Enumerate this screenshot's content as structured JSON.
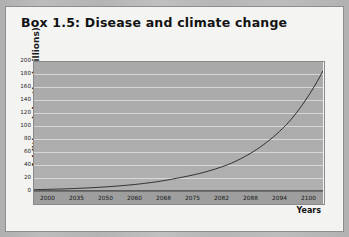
{
  "page": {
    "background_color": "#b6b6b6",
    "card_background": "#f3f3f2",
    "border_color": "#8d8d8d"
  },
  "box": {
    "title": "Box 1.5: Disease and climate change"
  },
  "chart_data": {
    "type": "line",
    "title": "",
    "xlabel": "Years",
    "ylabel": "Additional deaths (millions)",
    "categories": [
      "2000",
      "2035",
      "2050",
      "2060",
      "2068",
      "2075",
      "2082",
      "2088",
      "2094",
      "2100"
    ],
    "x": [
      2000,
      2035,
      2050,
      2060,
      2068,
      2075,
      2082,
      2088,
      2094,
      2100
    ],
    "values": [
      2,
      10,
      20,
      30,
      42,
      58,
      80,
      105,
      140,
      185
    ],
    "series": [
      {
        "name": "Additional deaths",
        "values": [
          2,
          10,
          20,
          30,
          42,
          58,
          80,
          105,
          140,
          185
        ],
        "color": "#1d1d1d"
      }
    ],
    "ylim": [
      0,
      200
    ],
    "yticks": [
      0,
      20,
      40,
      60,
      80,
      100,
      120,
      140,
      160,
      180,
      200
    ],
    "ytick_labels": [
      "0",
      "20",
      "40",
      "60",
      "80",
      "100",
      "120",
      "140",
      "160",
      "180",
      "200"
    ],
    "xlim": [
      2000,
      2100
    ],
    "grid": "horizontal",
    "legend": "none",
    "plot_background": "#ababab",
    "gridline_color": "#e8e8e8",
    "line_color": "#1d1d1d"
  }
}
